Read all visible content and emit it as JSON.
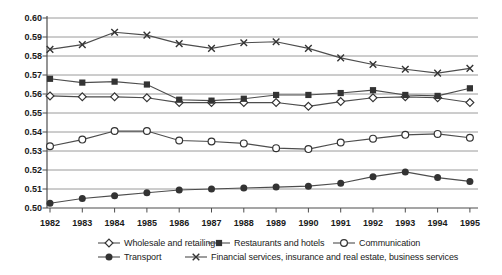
{
  "chart_data": {
    "type": "line",
    "title": "",
    "xlabel": "",
    "ylabel": "",
    "x": [
      1982,
      1983,
      1984,
      1985,
      1986,
      1987,
      1988,
      1989,
      1990,
      1991,
      1992,
      1993,
      1994,
      1995
    ],
    "ylim": [
      0.5,
      0.6
    ],
    "ytick_step": 0.01,
    "ytick_labels": [
      "0.60",
      "0.59",
      "0.58",
      "0.57",
      "0.56",
      "0.55",
      "0.54",
      "0.53",
      "0.52",
      "0.51",
      "0.50"
    ],
    "grid": "horizontal",
    "legend_position": "bottom",
    "series": [
      {
        "name": "Wholesale and retailing",
        "marker": "diamond-open",
        "values": [
          0.559,
          0.5585,
          0.5585,
          0.558,
          0.5555,
          0.5555,
          0.5555,
          0.5555,
          0.5535,
          0.556,
          0.558,
          0.5585,
          0.558,
          0.5555
        ]
      },
      {
        "name": "Restaurants and hotels",
        "marker": "square-filled",
        "values": [
          0.568,
          0.566,
          0.5665,
          0.565,
          0.557,
          0.5565,
          0.5575,
          0.5595,
          0.5595,
          0.5605,
          0.562,
          0.5595,
          0.559,
          0.563
        ]
      },
      {
        "name": "Communication",
        "marker": "circle-open",
        "values": [
          0.5325,
          0.536,
          0.5405,
          0.5405,
          0.5355,
          0.535,
          0.534,
          0.5315,
          0.531,
          0.5345,
          0.5365,
          0.5385,
          0.539,
          0.537
        ]
      },
      {
        "name": "Transport",
        "marker": "circle-filled",
        "values": [
          0.5025,
          0.505,
          0.5065,
          0.508,
          0.5095,
          0.51,
          0.5105,
          0.511,
          0.5115,
          0.513,
          0.5165,
          0.519,
          0.516,
          0.514
        ]
      },
      {
        "name": "Financial services, insurance and real estate, business services",
        "marker": "x-cross",
        "values": [
          0.5835,
          0.586,
          0.5925,
          0.591,
          0.5865,
          0.584,
          0.587,
          0.5875,
          0.584,
          0.579,
          0.5755,
          0.573,
          0.571,
          0.5735
        ]
      }
    ],
    "colors": {
      "background": "#ffffff",
      "grid": "#8f8f8f",
      "axis": "#4d4d4d",
      "line": "#4d4d4d",
      "marker": "#333333",
      "text": "#1a1a1a"
    }
  }
}
